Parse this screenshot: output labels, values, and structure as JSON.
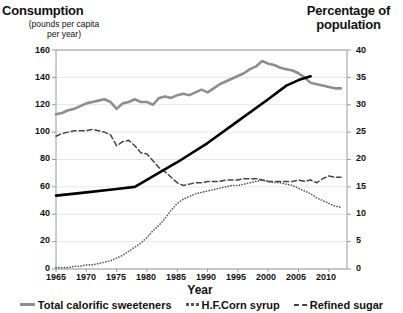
{
  "chart_data": {
    "type": "line",
    "title": "",
    "xlabel": "Year",
    "ylabel": "Consumption",
    "ylabel_sub": "(pounds per capita per year)",
    "y2label": "Percentage of population",
    "xlim": [
      1965,
      2013
    ],
    "ylim": [
      0,
      160
    ],
    "y2lim": [
      0,
      40
    ],
    "grid": true,
    "legend_position": "bottom",
    "left_axis_title": "Consumption",
    "left_axis_subtitle_line1": "(pounds per capita",
    "left_axis_subtitle_line2": "per year)",
    "right_axis_title_line1": "Percentage of",
    "right_axis_title_line2": "population",
    "y_ticks": [
      "160",
      "140",
      "120",
      "100",
      "80",
      "60",
      "40",
      "20",
      "0"
    ],
    "y2_ticks": [
      "40",
      "35",
      "30",
      "25",
      "20",
      "15",
      "10",
      "5",
      "0"
    ],
    "x_ticks": [
      "1965",
      "1970",
      "1975",
      "1980",
      "1985",
      "1990",
      "1995",
      "2000",
      "2005",
      "2010"
    ],
    "colors": {
      "total_calorific_sweeteners": "#8e8e8e",
      "hf_corn_syrup": "#555555",
      "refined_sugar": "#444444",
      "obesity_line": "#000000",
      "gridline": "#e6e6e6",
      "axis": "#9a9a9a"
    },
    "series": [
      {
        "name": "Total calorific sweeteners",
        "style": "solid",
        "color": "#8e8e8e",
        "axis": "left",
        "x": [
          1965,
          1966,
          1967,
          1968,
          1969,
          1970,
          1971,
          1972,
          1973,
          1974,
          1975,
          1976,
          1977,
          1978,
          1979,
          1980,
          1981,
          1982,
          1983,
          1984,
          1985,
          1986,
          1987,
          1988,
          1989,
          1990,
          1991,
          1992,
          1993,
          1994,
          1995,
          1996,
          1997,
          1998,
          1999,
          2000,
          2001,
          2002,
          2003,
          2004,
          2005,
          2006,
          2007,
          2008,
          2009,
          2010,
          2011,
          2012
        ],
        "values": [
          113,
          114,
          116,
          117,
          119,
          121,
          122,
          123,
          124,
          122,
          117,
          121,
          122,
          124,
          122,
          122,
          120,
          125,
          126,
          125,
          127,
          128,
          127,
          129,
          131,
          129,
          132,
          135,
          137,
          139,
          141,
          143,
          146,
          148,
          152,
          150,
          149,
          147,
          146,
          145,
          143,
          140,
          136,
          135,
          134,
          133,
          132,
          132
        ]
      },
      {
        "name": "H.F.Corn syrup",
        "style": "dotted",
        "color": "#555555",
        "axis": "left",
        "x": [
          1965,
          1966,
          1967,
          1968,
          1969,
          1970,
          1971,
          1972,
          1973,
          1974,
          1975,
          1976,
          1977,
          1978,
          1979,
          1980,
          1981,
          1982,
          1983,
          1984,
          1985,
          1986,
          1987,
          1988,
          1989,
          1990,
          1991,
          1992,
          1993,
          1994,
          1995,
          1996,
          1997,
          1998,
          1999,
          2000,
          2001,
          2002,
          2003,
          2004,
          2005,
          2006,
          2007,
          2008,
          2009,
          2010,
          2011,
          2012
        ],
        "values": [
          1,
          1,
          1,
          2,
          2,
          3,
          3,
          4,
          5,
          6,
          8,
          10,
          13,
          16,
          19,
          23,
          28,
          32,
          37,
          43,
          48,
          51,
          53,
          55,
          56,
          57,
          58,
          59,
          60,
          61,
          61,
          62,
          63,
          64,
          65,
          64,
          63,
          63,
          62,
          61,
          59,
          57,
          55,
          52,
          50,
          48,
          46,
          45
        ]
      },
      {
        "name": "Refined sugar",
        "style": "dashed",
        "color": "#444444",
        "axis": "left",
        "x": [
          1965,
          1966,
          1967,
          1968,
          1969,
          1970,
          1971,
          1972,
          1973,
          1974,
          1975,
          1976,
          1977,
          1978,
          1979,
          1980,
          1981,
          1982,
          1983,
          1984,
          1985,
          1986,
          1987,
          1988,
          1989,
          1990,
          1991,
          1992,
          1993,
          1994,
          1995,
          1996,
          1997,
          1998,
          1999,
          2000,
          2001,
          2002,
          2003,
          2004,
          2005,
          2006,
          2007,
          2008,
          2009,
          2010,
          2011,
          2012
        ],
        "values": [
          97,
          99,
          100,
          101,
          101,
          101,
          102,
          101,
          100,
          98,
          90,
          93,
          94,
          90,
          85,
          84,
          79,
          74,
          71,
          67,
          63,
          61,
          62,
          63,
          63,
          64,
          64,
          64,
          65,
          65,
          65,
          66,
          66,
          66,
          65,
          64,
          64,
          64,
          64,
          64,
          65,
          64,
          65,
          63,
          66,
          68,
          67,
          67
        ]
      },
      {
        "name": "Obesity rate",
        "style": "solid-thick",
        "color": "#000000",
        "axis": "right",
        "x": [
          1965,
          1970,
          1975,
          1978,
          1985,
          1990,
          1995,
          2000,
          2003,
          2005,
          2007
        ],
        "values": [
          13.4,
          14.0,
          14.6,
          15.0,
          19.5,
          23.0,
          27.0,
          31.0,
          33.5,
          34.5,
          35.2
        ]
      }
    ]
  },
  "legend": {
    "items": [
      {
        "label": "Total calorific sweeteners",
        "marker": "solid-gray"
      },
      {
        "label": "H.F.Corn syrup",
        "marker": "dotted"
      },
      {
        "label": "Refined sugar",
        "marker": "dashed"
      }
    ]
  }
}
